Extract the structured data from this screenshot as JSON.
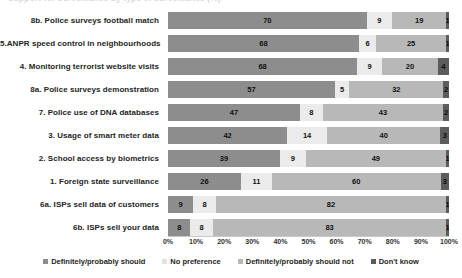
{
  "title": {
    "text": "Support for surveillance by type of surveillance (%)",
    "visible_clipped": true
  },
  "chart_data": {
    "type": "bar",
    "orientation": "horizontal",
    "stacked": true,
    "normalized_percent": true,
    "title": "Support for surveillance by type of surveillance (%)",
    "xlabel": "",
    "ylabel": "",
    "xlim": [
      0,
      100
    ],
    "grid": false,
    "legend_position": "bottom",
    "categories": [
      "8b. Police surveys football match",
      "5.ANPR  speed control in neighbourhoods",
      "4. Monitoring terrorist website visits",
      "8a. Police surveys demonstration",
      "7. Police use of DNA databases",
      "3. Usage of smart meter data",
      "2. School access by biometrics",
      "1. Foreign state surveillance",
      "6a. ISPs sell data of customers",
      "6b. ISPs sell your data"
    ],
    "series": [
      {
        "name": "Definitely/probably should",
        "color": "#8d8d8d",
        "values": [
          70,
          68,
          68,
          57,
          47,
          42,
          39,
          26,
          9,
          8
        ]
      },
      {
        "name": "No preference",
        "color": "#ebebeb",
        "values": [
          9,
          6,
          9,
          5,
          8,
          14,
          9,
          11,
          8,
          8
        ]
      },
      {
        "name": "Definitely/probably should not",
        "color": "#b8b8b8",
        "values": [
          19,
          25,
          20,
          32,
          43,
          40,
          49,
          60,
          82,
          83
        ]
      },
      {
        "name": "Don't know",
        "color": "#5c5c5c",
        "values": [
          1,
          1,
          4,
          2,
          2,
          3,
          1,
          3,
          1,
          1
        ]
      }
    ],
    "xticks": [
      "0%",
      "10%",
      "20%",
      "30%",
      "40%",
      "50%",
      "60%",
      "70%",
      "80%",
      "90%",
      "100%"
    ],
    "xtick_values": [
      0,
      10,
      20,
      30,
      40,
      50,
      60,
      70,
      80,
      90,
      100
    ]
  },
  "legend": {
    "items": [
      {
        "label": "Definitely/probably should",
        "swatch": "s1"
      },
      {
        "label": "No preference",
        "swatch": "s2"
      },
      {
        "label": "Definitely/probably should not",
        "swatch": "s3"
      },
      {
        "label": "Don't know",
        "swatch": "s4"
      }
    ]
  }
}
